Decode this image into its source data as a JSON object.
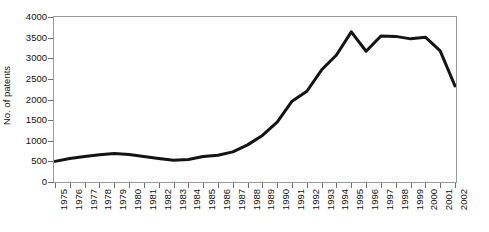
{
  "chart_data": {
    "type": "line",
    "title": "",
    "xlabel": "",
    "ylabel": "No. of patents",
    "xlim": [
      1975,
      2002
    ],
    "ylim": [
      0,
      4000
    ],
    "grid": false,
    "legend": null,
    "y_ticks": [
      0,
      500,
      1000,
      1500,
      2000,
      2500,
      3000,
      3500,
      4000
    ],
    "y_tick_labels": [
      "0",
      "500",
      "1000",
      "1500",
      "2000",
      "2500",
      "3000",
      "3500",
      "4000"
    ],
    "categories": [
      "1975",
      "1976",
      "1977",
      "1978",
      "1979",
      "1980",
      "1981",
      "1982",
      "1983",
      "1984",
      "1985",
      "1986",
      "1987",
      "1988",
      "1989",
      "1990",
      "1991",
      "1992",
      "1993",
      "1994",
      "1995",
      "1996",
      "1997",
      "1998",
      "1999",
      "2000",
      "2001",
      "2002"
    ],
    "x": [
      1975,
      1976,
      1977,
      1978,
      1979,
      1980,
      1981,
      1982,
      1983,
      1984,
      1985,
      1986,
      1987,
      1988,
      1989,
      1990,
      1991,
      1992,
      1993,
      1994,
      1995,
      1996,
      1997,
      1998,
      1999,
      2000,
      2001,
      2002
    ],
    "values": [
      500,
      570,
      620,
      660,
      690,
      665,
      620,
      570,
      525,
      545,
      620,
      650,
      730,
      900,
      1130,
      1450,
      1960,
      2200,
      2720,
      3080,
      3640,
      3170,
      3540,
      3530,
      3470,
      3510,
      3180,
      2330
    ],
    "series": [
      {
        "name": "No. of patents",
        "color": "#141414",
        "line_width": 3,
        "values": [
          500,
          570,
          620,
          660,
          690,
          665,
          620,
          570,
          525,
          545,
          620,
          650,
          730,
          900,
          1130,
          1450,
          1960,
          2200,
          2720,
          3080,
          3640,
          3170,
          3540,
          3530,
          3470,
          3510,
          3180,
          2330
        ]
      }
    ]
  },
  "style": {
    "line_color": "#141414",
    "frame_color": "#9a9a9a",
    "tick_color": "#6e6e6e",
    "text_color": "#111111",
    "background": "#ffffff"
  }
}
